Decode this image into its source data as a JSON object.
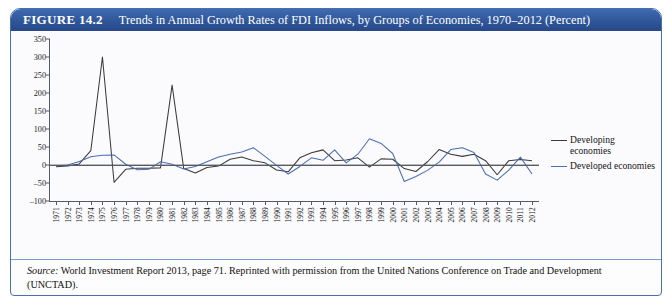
{
  "figure": {
    "number": "FIGURE 14.2",
    "title": "Trends in Annual Growth Rates of FDI Inflows, by Groups of Economies, 1970–2012 (Percent)",
    "header_color": "#2f5699",
    "border_color": "#4a6fae"
  },
  "legend": {
    "position": "right",
    "entries": [
      {
        "label": "Developing economies",
        "color": "#3b3b3b",
        "swatch": "line-swatch-developing"
      },
      {
        "label": "Developed economies",
        "color": "#4a6fb5",
        "swatch": "line-swatch-developed"
      }
    ]
  },
  "source": {
    "lead": "Source:",
    "text": " World Investment Report 2013, page 71. Reprinted with permission  from the United Nations Conference on Trade and Development (UNCTAD)."
  },
  "chart_data": {
    "type": "line",
    "title": "Trends in Annual Growth Rates of FDI Inflows, by Groups of Economies, 1970–2012 (Percent)",
    "xlabel": "",
    "ylabel": "",
    "ylim": [
      -100,
      350
    ],
    "yticks": [
      -100,
      -50,
      0,
      50,
      100,
      150,
      200,
      250,
      300,
      350
    ],
    "grid": false,
    "zero_line": 0,
    "categories": [
      "1971",
      "1972",
      "1973",
      "1974",
      "1975",
      "1976",
      "1977",
      "1978",
      "1979",
      "1980",
      "1981",
      "1982",
      "1983",
      "1984",
      "1985",
      "1986",
      "1987",
      "1988",
      "1989",
      "1990",
      "1991",
      "1992",
      "1993",
      "1994",
      "1995",
      "1996",
      "1997",
      "1998",
      "1999",
      "2000",
      "2001",
      "2002",
      "2003",
      "2004",
      "2005",
      "2006",
      "2007",
      "2008",
      "2009",
      "2010",
      "2011",
      "2012"
    ],
    "series": [
      {
        "name": "Developing economies",
        "color": "#3b3b3b",
        "values": [
          -5,
          -3,
          3,
          40,
          300,
          -48,
          -12,
          -9,
          -9,
          -8,
          222,
          -10,
          -22,
          -7,
          -3,
          16,
          22,
          12,
          6,
          -14,
          -19,
          20,
          34,
          42,
          12,
          14,
          20,
          -6,
          17,
          16,
          -10,
          -18,
          9,
          43,
          30,
          24,
          30,
          12,
          -27,
          12,
          15,
          12
        ]
      },
      {
        "name": "Developed economies",
        "color": "#4a6fb5",
        "values": [
          -2,
          0,
          10,
          23,
          27,
          28,
          2,
          -13,
          -12,
          9,
          2,
          -11,
          -4,
          9,
          22,
          30,
          36,
          48,
          24,
          -1,
          -25,
          -4,
          20,
          13,
          42,
          6,
          30,
          73,
          60,
          32,
          -46,
          -32,
          -15,
          8,
          43,
          48,
          35,
          -25,
          -42,
          -14,
          22,
          -25
        ]
      }
    ]
  }
}
